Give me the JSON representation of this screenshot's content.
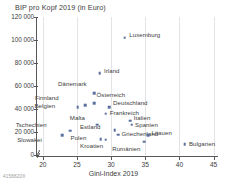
{
  "chart_data": {
    "type": "scatter",
    "title": "BIP pro Kopf 2019 (in Euro)",
    "xlabel": "Gini-Index 2019",
    "ylabel": "BIP pro Kopf 2019 (in Euro)",
    "xlim": [
      19,
      45.5
    ],
    "ylim": [
      0,
      120000
    ],
    "xticks": [
      20,
      25,
      30,
      35,
      40,
      45
    ],
    "xticklabels": [
      "20",
      "25",
      "30",
      "35",
      "40",
      "45"
    ],
    "yticks": [
      0,
      20000,
      40000,
      60000,
      80000,
      100000,
      120000
    ],
    "yticklabels": [
      "0",
      "20 000",
      "40 000",
      "60 000",
      "80 000",
      "100 000",
      "120 000"
    ],
    "grid": "vertical",
    "legend": "none",
    "marker_color": "#5b6f9e",
    "axis_color": "#58585a",
    "grid_color": "#e4e4e6",
    "points": [
      {
        "name": "Luxemburg",
        "x": 32.0,
        "y": 102000,
        "label_dx": 4.5,
        "label_dy": -2.5,
        "wrap": false
      },
      {
        "name": "Irland",
        "x": 28.3,
        "y": 71000,
        "label_dx": 4.5,
        "label_dy": -2.5,
        "wrap": false
      },
      {
        "name": "Dänemark",
        "x": 27.5,
        "y": 53500,
        "label_dx": -10.0,
        "label_dy": -9.5,
        "wrap": false
      },
      {
        "name": "Österreich",
        "x": 27.5,
        "y": 45000,
        "label_dx": 2.5,
        "label_dy": -8.0,
        "wrap": false
      },
      {
        "name": "Finnland",
        "x": 26.2,
        "y": 43500,
        "label_dx": -29.0,
        "label_dy": -6.5,
        "wrap": false
      },
      {
        "name": "Belgien",
        "x": 25.1,
        "y": 41500,
        "label_dx": -25.0,
        "label_dy": -1.5,
        "wrap": false
      },
      {
        "name": "Deutschland",
        "x": 29.7,
        "y": 41500,
        "label_dx": 4.0,
        "label_dy": -4.5,
        "wrap": false
      },
      {
        "name": "Frankreich",
        "x": 29.2,
        "y": 36000,
        "label_dx": 4.0,
        "label_dy": -0.5,
        "wrap": false
      },
      {
        "name": "Italien",
        "x": 32.8,
        "y": 29700,
        "label_dx": 3.5,
        "label_dy": -3.0,
        "wrap": false
      },
      {
        "name": "Spanien",
        "x": 33.0,
        "y": 26500,
        "label_dx": 3.5,
        "label_dy": 0.5,
        "wrap": false
      },
      {
        "name": "Malta",
        "x": 28.0,
        "y": 26500,
        "label_dx": -15.0,
        "label_dy": -6.5,
        "wrap": false
      },
      {
        "name": "Estland",
        "x": 30.5,
        "y": 21500,
        "label_dx": -16.5,
        "label_dy": -3.0,
        "wrap": false
      },
      {
        "name": "Tschechien",
        "x": 24.0,
        "y": 21000,
        "label_dx": -26.0,
        "label_dy": -6.0,
        "wrap": false
      },
      {
        "name": "Griechenland",
        "x": 31.0,
        "y": 17500,
        "label_dx": 3.5,
        "label_dy": -1.0,
        "wrap": true
      },
      {
        "name": "Litauen",
        "x": 35.4,
        "y": 17300,
        "label_dx": 3.5,
        "label_dy": -2.0,
        "wrap": false
      },
      {
        "name": "Slowakei",
        "x": 22.8,
        "y": 17000,
        "label_dx": -22.5,
        "label_dy": 4.5,
        "wrap": false
      },
      {
        "name": "Polen",
        "x": 28.5,
        "y": 13800,
        "label_dx": -17.0,
        "label_dy": -1.5,
        "wrap": false
      },
      {
        "name": "Kroatien",
        "x": 29.2,
        "y": 13200,
        "label_dx": -5.0,
        "label_dy": 6.0,
        "wrap": false
      },
      {
        "name": "Rumänien",
        "x": 34.8,
        "y": 11500,
        "label_dx": -6.0,
        "label_dy": 7.0,
        "wrap": false
      },
      {
        "name": "Bulgarien",
        "x": 40.8,
        "y": 9200,
        "label_dx": 4.0,
        "label_dy": -0.5,
        "wrap": false
      }
    ]
  },
  "source": {
    "code": "4158820X"
  }
}
